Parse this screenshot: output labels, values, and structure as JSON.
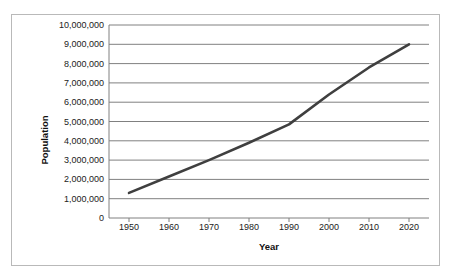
{
  "chart_data": {
    "type": "line",
    "title": "",
    "xlabel": "Year",
    "ylabel": "Population",
    "x": [
      1950,
      1960,
      1970,
      1980,
      1990,
      2000,
      2010,
      2020
    ],
    "series": [
      {
        "name": "Population",
        "values": [
          1300000,
          2150000,
          3000000,
          3900000,
          4850000,
          6400000,
          7800000,
          9000000
        ],
        "color": "#3f3f3f"
      }
    ],
    "xlim": [
      1945,
      2025
    ],
    "ylim": [
      0,
      10000000
    ],
    "ytick_values": [
      0,
      1000000,
      2000000,
      3000000,
      4000000,
      5000000,
      6000000,
      7000000,
      8000000,
      9000000,
      10000000
    ],
    "ytick_labels": [
      "0",
      "1,000,000",
      "2,000,000",
      "3,000,000",
      "4,000,000",
      "5,000,000",
      "6,000,000",
      "7,000,000",
      "8,000,000",
      "9,000,000",
      "10,000,000"
    ],
    "xtick_values": [
      1950,
      1960,
      1970,
      1980,
      1990,
      2000,
      2010,
      2020
    ],
    "xtick_labels": [
      "1950",
      "1960",
      "1970",
      "1980",
      "1990",
      "2000",
      "2010",
      "2020"
    ],
    "grid": {
      "horizontal": true,
      "vertical": false,
      "color": "#808080"
    },
    "legend": {
      "visible": false,
      "position": "none"
    },
    "plot_border_color": "#808080",
    "frame_border_color": "#b9b9b9",
    "background_color": "#ffffff"
  }
}
